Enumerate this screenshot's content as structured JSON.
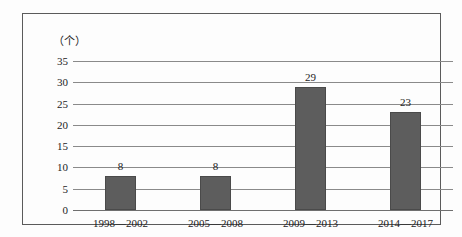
{
  "chart_data": {
    "type": "bar",
    "title": "",
    "subtitle": "",
    "xlabel": "",
    "ylabel": "（个）",
    "unit_label": "（个）",
    "categories": [
      "1998—2002",
      "2005—2008",
      "2009—2013",
      "2014—2017"
    ],
    "values": [
      8,
      8,
      29,
      23
    ],
    "value_labels": [
      "8",
      "8",
      "29",
      "23"
    ],
    "ylim": [
      0,
      35
    ],
    "ytick_step": 5,
    "yticks": [
      "0",
      "5",
      "10",
      "15",
      "20",
      "25",
      "30",
      "35"
    ],
    "ytick_values": [
      0,
      5,
      10,
      15,
      20,
      25,
      30,
      35
    ],
    "grid": true,
    "grid_orientation": "horizontal",
    "legend": false,
    "legend_position": "none",
    "series": [
      {
        "name": "",
        "values": [
          8,
          8,
          29,
          23
        ]
      }
    ],
    "colors": {
      "bar_fill": "#5d5d5d",
      "bar_border": "#4a4a4a",
      "gridline": "#8a8a8a",
      "axis": "#6f6f6f",
      "text": "#1c1c1c",
      "frame": "#5b5b5b",
      "background": "#fdfdfd"
    }
  }
}
